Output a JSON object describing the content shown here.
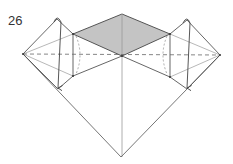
{
  "diagram": {
    "step_number": "26",
    "type": "origami fold step",
    "colors": {
      "line": "#555555",
      "thin_line": "#9a9a9a",
      "shaded_face": "#c4c4c4",
      "background": "#ffffff"
    },
    "elements": [
      "shaded square (top face)",
      "left flap with fold-down arrow",
      "right flap with fold-down arrow",
      "dashed horizontal valley line",
      "central vertical crease",
      "bottom point"
    ]
  }
}
